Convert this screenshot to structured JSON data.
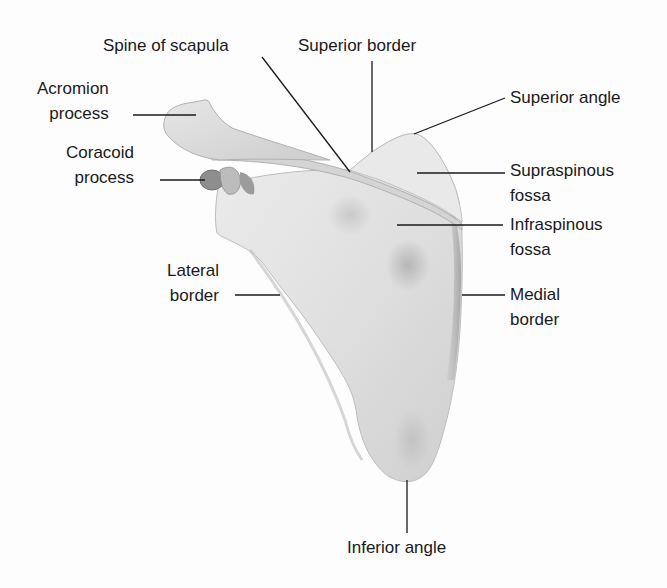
{
  "diagram": {
    "colors": {
      "background": "#fdfdfd",
      "bone_light": "#f2f2f2",
      "bone_mid": "#dcdcdc",
      "bone_shadow": "#a8a8a8",
      "leader_line": "#1a1a1a",
      "text": "#1a1a1a"
    },
    "labels": [
      {
        "id": "spine-of-scapula",
        "text": "Spine of scapula",
        "x": 103,
        "y": 33,
        "align": "left",
        "leader": {
          "x1": 262,
          "y1": 57,
          "x2": 350,
          "y2": 172
        }
      },
      {
        "id": "superior-border",
        "text": "Superior border",
        "x": 298,
        "y": 33,
        "align": "left",
        "leader": {
          "x1": 372,
          "y1": 61,
          "x2": 372,
          "y2": 152
        }
      },
      {
        "id": "acromion-process",
        "text": "Acromion\nprocess",
        "x": 37,
        "y": 76,
        "align": "right",
        "leader": {
          "x1": 133,
          "y1": 115,
          "x2": 196,
          "y2": 115
        }
      },
      {
        "id": "coracoid-process",
        "text": "Coracoid\nprocess",
        "x": 66,
        "y": 140,
        "align": "right",
        "leader": {
          "x1": 160,
          "y1": 180,
          "x2": 205,
          "y2": 180
        }
      },
      {
        "id": "superior-angle",
        "text": "Superior angle",
        "x": 510,
        "y": 85,
        "align": "left",
        "leader": {
          "x1": 505,
          "y1": 98,
          "x2": 414,
          "y2": 134
        }
      },
      {
        "id": "supraspinous-fossa",
        "text": "Supraspinous\nfossa",
        "x": 510,
        "y": 158,
        "align": "left",
        "leader": {
          "x1": 505,
          "y1": 173,
          "x2": 417,
          "y2": 173
        }
      },
      {
        "id": "infraspinous-fossa",
        "text": "Infraspinous\nfossa",
        "x": 510,
        "y": 212,
        "align": "left",
        "leader": {
          "x1": 503,
          "y1": 225,
          "x2": 397,
          "y2": 225
        }
      },
      {
        "id": "lateral-border",
        "text": "Lateral\nborder",
        "x": 167,
        "y": 258,
        "align": "right",
        "leader": {
          "x1": 235,
          "y1": 295,
          "x2": 280,
          "y2": 295
        }
      },
      {
        "id": "medial-border",
        "text": "Medial\nborder",
        "x": 510,
        "y": 282,
        "align": "left",
        "leader": {
          "x1": 505,
          "y1": 295,
          "x2": 462,
          "y2": 295
        }
      },
      {
        "id": "inferior-angle",
        "text": "Inferior angle",
        "x": 347,
        "y": 535,
        "align": "left",
        "leader": {
          "x1": 407,
          "y1": 480,
          "x2": 407,
          "y2": 533
        }
      }
    ]
  }
}
